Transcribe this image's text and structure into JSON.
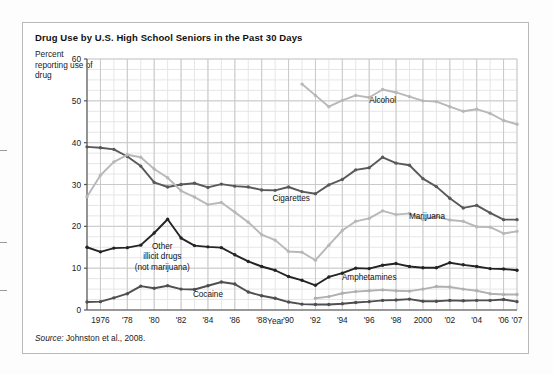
{
  "figure": {
    "title": "Drug Use by U.S. High School Seniors in the Past 30 Days",
    "y_axis_note": "Percent reporting use of drug",
    "x_axis_title": "Year",
    "source_prefix": "Source:",
    "source_text": " Johnston et al., 2008."
  },
  "chart_data": {
    "type": "line",
    "title": "Drug Use by U.S. High School Seniors in the Past 30 Days",
    "xlabel": "Year",
    "ylabel": "Percent reporting use of drug",
    "xlim": [
      1975,
      2007
    ],
    "ylim": [
      0,
      60
    ],
    "ytick_labels": [
      "0",
      "10",
      "20",
      "30",
      "40",
      "50",
      "60"
    ],
    "yticks": [
      0,
      10,
      20,
      30,
      40,
      50,
      60
    ],
    "xtick_labels": [
      "1976",
      "'78",
      "'80",
      "'82",
      "'84",
      "'86",
      "'88",
      "'90",
      "'92",
      "'94",
      "'96",
      "'98",
      "2000",
      "'02",
      "'04",
      "'06",
      "'07"
    ],
    "xticks": [
      1976,
      1978,
      1980,
      1982,
      1984,
      1986,
      1988,
      1990,
      1992,
      1994,
      1996,
      1998,
      2000,
      2002,
      2004,
      2006,
      2007
    ],
    "grid": true,
    "grid_minor": true,
    "legend_position": "inline-labels",
    "colors": {
      "alcohol": "#b8b8b8",
      "cigarettes": "#595959",
      "marijuana": "#b8b8b8",
      "other_illicit": "#242424",
      "amphetamines": "#b0b0b0",
      "cocaine": "#4f4f4f",
      "grid_major": "#c9c9c9",
      "grid_minor": "#e6e6e6",
      "axis": "#555555"
    },
    "series": [
      {
        "name": "Alcohol",
        "color": "#b8b8b8",
        "label_x": 1997.0,
        "label_y": 49.6,
        "x": [
          1991,
          1992,
          1993,
          1994,
          1995,
          1996,
          1997,
          1998,
          1999,
          2000,
          2001,
          2002,
          2003,
          2004,
          2005,
          2006,
          2007
        ],
        "values": [
          54.0,
          51.3,
          48.6,
          50.1,
          51.3,
          50.8,
          52.7,
          52.0,
          51.0,
          50.0,
          49.8,
          48.6,
          47.5,
          48.0,
          47.0,
          45.3,
          44.4
        ]
      },
      {
        "name": "Cigarettes",
        "color": "#595959",
        "label_x": 1990.2,
        "label_y": 26.0,
        "x": [
          1975,
          1976,
          1977,
          1978,
          1979,
          1980,
          1981,
          1982,
          1983,
          1984,
          1985,
          1986,
          1987,
          1988,
          1989,
          1990,
          1991,
          1992,
          1993,
          1994,
          1995,
          1996,
          1997,
          1998,
          1999,
          2000,
          2001,
          2002,
          2003,
          2004,
          2005,
          2006,
          2007
        ],
        "values": [
          39.0,
          38.8,
          38.4,
          36.7,
          34.4,
          30.5,
          29.4,
          30.0,
          30.3,
          29.3,
          30.1,
          29.6,
          29.4,
          28.7,
          28.6,
          29.4,
          28.3,
          27.8,
          29.9,
          31.2,
          33.5,
          34.0,
          36.5,
          35.1,
          34.6,
          31.4,
          29.5,
          26.7,
          24.4,
          25.0,
          23.2,
          21.6,
          21.6
        ]
      },
      {
        "name": "Marijuana",
        "color": "#b8b8b8",
        "label_x": 2000.3,
        "label_y": 21.8,
        "x": [
          1975,
          1976,
          1977,
          1978,
          1979,
          1980,
          1981,
          1982,
          1983,
          1984,
          1985,
          1986,
          1987,
          1988,
          1989,
          1990,
          1991,
          1992,
          1993,
          1994,
          1995,
          1996,
          1997,
          1998,
          1999,
          2000,
          2001,
          2002,
          2003,
          2004,
          2005,
          2006,
          2007
        ],
        "values": [
          27.1,
          32.2,
          35.4,
          37.1,
          36.5,
          33.7,
          31.6,
          28.5,
          27.0,
          25.2,
          25.7,
          23.4,
          21.0,
          18.0,
          16.7,
          14.0,
          13.8,
          11.9,
          15.5,
          19.0,
          21.2,
          21.9,
          23.7,
          22.8,
          23.1,
          21.6,
          22.4,
          21.5,
          21.2,
          19.9,
          19.8,
          18.3,
          18.8
        ]
      },
      {
        "name": "Other illicit drugs (not marijuana)",
        "color": "#242424",
        "label_x": 1980.6,
        "label_y": 14.7,
        "x": [
          1975,
          1976,
          1977,
          1978,
          1979,
          1980,
          1981,
          1982,
          1983,
          1984,
          1985,
          1986,
          1987,
          1988,
          1989,
          1990,
          1991,
          1992,
          1993,
          1994,
          1995,
          1996,
          1997,
          1998,
          1999,
          2000,
          2001,
          2002,
          2003,
          2004,
          2005,
          2006,
          2007
        ],
        "values": [
          15.0,
          13.9,
          14.8,
          14.9,
          15.5,
          18.4,
          21.7,
          17.2,
          15.4,
          15.1,
          14.9,
          13.2,
          11.6,
          10.4,
          9.5,
          8.0,
          7.1,
          5.9,
          7.9,
          8.8,
          10.0,
          9.9,
          10.7,
          11.1,
          10.4,
          10.1,
          10.1,
          11.3,
          10.8,
          10.4,
          9.9,
          9.8,
          9.5
        ]
      },
      {
        "name": "Amphetamines",
        "color": "#b0b0b0",
        "label_x": 1996.0,
        "label_y": 7.1,
        "x": [
          1992,
          1993,
          1994,
          1995,
          1996,
          1997,
          1998,
          1999,
          2000,
          2001,
          2002,
          2003,
          2004,
          2005,
          2006,
          2007
        ],
        "values": [
          2.8,
          3.2,
          4.0,
          4.4,
          4.6,
          4.8,
          4.6,
          4.5,
          5.0,
          5.6,
          5.5,
          5.0,
          4.6,
          3.9,
          3.7,
          3.7
        ]
      },
      {
        "name": "Cocaine",
        "color": "#4f4f4f",
        "label_x": 1984.0,
        "label_y": 3.0,
        "x": [
          1975,
          1976,
          1977,
          1978,
          1979,
          1980,
          1981,
          1982,
          1983,
          1984,
          1985,
          1986,
          1987,
          1988,
          1989,
          1990,
          1991,
          1992,
          1993,
          1994,
          1995,
          1996,
          1997,
          1998,
          1999,
          2000,
          2001,
          2002,
          2003,
          2004,
          2005,
          2006,
          2007
        ],
        "values": [
          1.9,
          2.0,
          2.9,
          3.9,
          5.7,
          5.2,
          5.8,
          5.0,
          4.9,
          5.8,
          6.7,
          6.2,
          4.3,
          3.4,
          2.8,
          1.9,
          1.4,
          1.3,
          1.3,
          1.5,
          1.8,
          2.0,
          2.3,
          2.4,
          2.6,
          2.1,
          2.1,
          2.3,
          2.2,
          2.3,
          2.3,
          2.5,
          2.0
        ]
      }
    ]
  }
}
